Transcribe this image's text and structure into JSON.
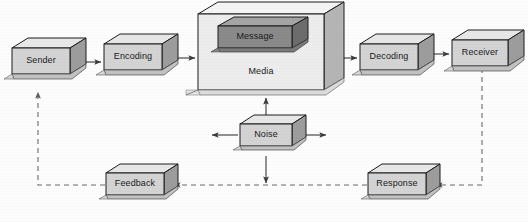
{
  "diagram": {
    "type": "block-flow-diagram",
    "colors": {
      "background": "#fdfdfd",
      "box_face": "#d4d4d4",
      "box_side": "#9d9d9d",
      "box_top": "#e8e8e8",
      "media_face": "#ededed",
      "media_side": "#b5b5b5",
      "media_top": "#f5f5f5",
      "message_face": "#8a8a8a",
      "message_side": "#6d6d6d",
      "message_top": "#a5a5a5",
      "outline": "#1c1c1c",
      "solid_arrow": "#3a3a3a",
      "dashed_arrow": "#6a6a6a",
      "label_text": "#1a1a1a"
    },
    "nodes": [
      {
        "id": "sender",
        "label": "Sender",
        "x": 12,
        "y": 48,
        "w": 58,
        "h": 26,
        "style": "standard"
      },
      {
        "id": "encoding",
        "label": "Encoding",
        "x": 104,
        "y": 44,
        "w": 58,
        "h": 26,
        "style": "standard"
      },
      {
        "id": "media",
        "label": "Media",
        "x": 198,
        "y": 14,
        "w": 126,
        "h": 76,
        "style": "large"
      },
      {
        "id": "message",
        "label": "Message",
        "x": 218,
        "y": 26,
        "w": 74,
        "h": 22,
        "style": "dark"
      },
      {
        "id": "decoding",
        "label": "Decoding",
        "x": 360,
        "y": 44,
        "w": 58,
        "h": 26,
        "style": "standard"
      },
      {
        "id": "receiver",
        "label": "Receiver",
        "x": 452,
        "y": 40,
        "w": 58,
        "h": 26,
        "style": "standard"
      },
      {
        "id": "noise",
        "label": "Noise",
        "x": 240,
        "y": 124,
        "w": 52,
        "h": 22,
        "style": "standard"
      },
      {
        "id": "feedback",
        "label": "Feedback",
        "x": 106,
        "y": 173,
        "w": 58,
        "h": 22,
        "style": "standard"
      },
      {
        "id": "response",
        "label": "Response",
        "x": 368,
        "y": 173,
        "w": 58,
        "h": 22,
        "style": "standard"
      }
    ],
    "edges": [
      {
        "id": "sender-to-encoding",
        "from": "sender",
        "to": "encoding",
        "line": "solid",
        "arrow": "end"
      },
      {
        "id": "encoding-to-media",
        "from": "encoding",
        "to": "media",
        "line": "solid",
        "arrow": "end"
      },
      {
        "id": "media-to-decoding",
        "from": "media",
        "to": "decoding",
        "line": "solid",
        "arrow": "end"
      },
      {
        "id": "decoding-to-receiver",
        "from": "decoding",
        "to": "receiver",
        "line": "solid",
        "arrow": "end"
      },
      {
        "id": "noise-to-media",
        "from": "noise",
        "to": "media",
        "line": "solid",
        "arrow": "end"
      },
      {
        "id": "noise-to-left",
        "from": "noise",
        "to": "outside",
        "line": "solid",
        "arrow": "end"
      },
      {
        "id": "noise-to-right",
        "from": "noise",
        "to": "outside",
        "line": "solid",
        "arrow": "end"
      },
      {
        "id": "noise-to-feedback-line",
        "from": "noise",
        "to": "response-path",
        "line": "solid",
        "arrow": "end"
      },
      {
        "id": "receiver-to-response",
        "from": "receiver",
        "to": "response",
        "line": "dashed",
        "arrow": "end"
      },
      {
        "id": "response-to-feedback",
        "from": "response",
        "to": "feedback",
        "line": "dashed",
        "arrow": "end"
      },
      {
        "id": "feedback-to-sender",
        "from": "feedback",
        "to": "sender",
        "line": "dashed",
        "arrow": "end"
      }
    ]
  }
}
